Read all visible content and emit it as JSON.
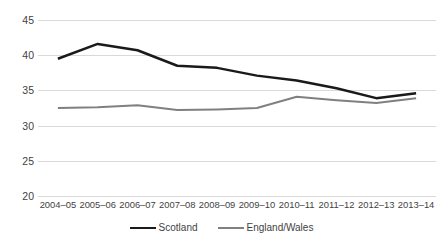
{
  "chart_data": {
    "type": "line",
    "title": "",
    "subtitle": "",
    "xlabel": "",
    "ylabel": "",
    "ylim": [
      20,
      45
    ],
    "yticks": [
      45,
      40,
      35,
      30,
      25,
      20
    ],
    "grid": true,
    "legend_position": "bottom-center",
    "categories": [
      "2004–05",
      "2005–06",
      "2006–07",
      "2007–08",
      "2008–09",
      "2009–10",
      "2010–11",
      "2011–12",
      "2012–13",
      "2013–14"
    ],
    "series": [
      {
        "name": "Scotland",
        "color": "#1a1a1a",
        "width": 2.5,
        "values": [
          39.5,
          41.6,
          40.7,
          38.5,
          38.2,
          37.1,
          36.4,
          35.3,
          33.9,
          34.6
        ]
      },
      {
        "name": "England/Wales",
        "color": "#808080",
        "width": 2.0,
        "values": [
          32.5,
          32.6,
          32.9,
          32.2,
          32.3,
          32.5,
          34.1,
          33.6,
          33.2,
          33.9
        ]
      }
    ]
  },
  "legend": {
    "items": [
      {
        "label": "Scotland",
        "color": "#1a1a1a",
        "width": 2.5
      },
      {
        "label": "England/Wales",
        "color": "#808080",
        "width": 2.0
      }
    ]
  },
  "colors": {
    "scotland": "#1a1a1a",
    "england_wales": "#808080",
    "gridline": "#d9d9d9",
    "text": "#3f3f3f",
    "background": "#ffffff"
  }
}
